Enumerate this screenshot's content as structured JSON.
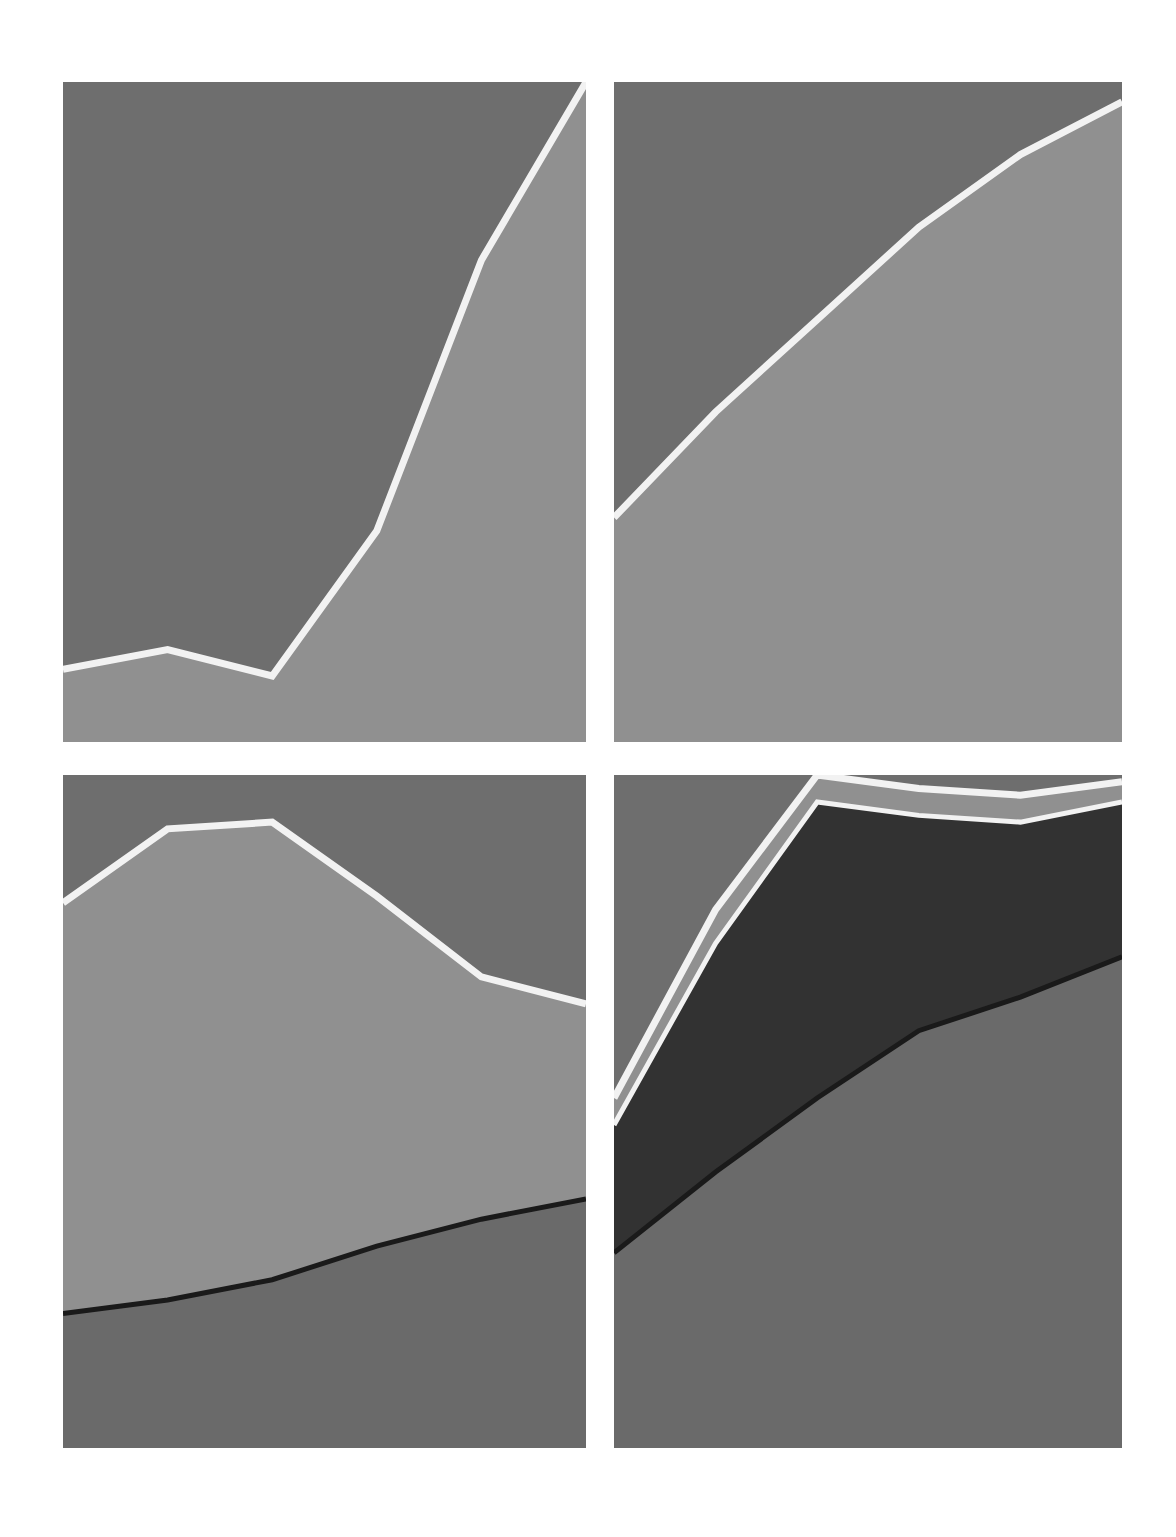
{
  "figure": {
    "background_color": "#ffffff",
    "layout": "2x2 grid of small-multiple stacked area charts",
    "panel_count": 4,
    "has_axes": false,
    "has_tick_labels": false,
    "has_legend": false,
    "has_title": false
  },
  "palette": {
    "plot_background": "#6e6e6e",
    "band_light": "#909090",
    "band_mid": "#6e6e6e",
    "band_dark": "#323232",
    "band_base": "#6a6a6a",
    "boundary_line": "#f2f2f2",
    "thin_dark_line": "#1a1a1a",
    "page_background": "#ffffff"
  },
  "chart_data": [
    {
      "id": "panel-top-left",
      "type": "area",
      "title": "",
      "subtitle": "",
      "xlabel": "",
      "ylabel": "",
      "grid": false,
      "legend_position": "none",
      "x": [
        0,
        1,
        2,
        3,
        4,
        5
      ],
      "xlim": [
        0,
        5
      ],
      "ylim": [
        0,
        100
      ],
      "xtick_labels": [],
      "ytick_labels": [],
      "series": [
        {
          "name": "lower band",
          "color": "#909090",
          "values": [
            11,
            14,
            10,
            32,
            73,
            100
          ]
        },
        {
          "name": "upper band",
          "color": "#6e6e6e",
          "values": [
            89,
            86,
            90,
            68,
            27,
            0
          ]
        }
      ],
      "annotations": []
    },
    {
      "id": "panel-top-right",
      "type": "area",
      "title": "",
      "subtitle": "",
      "xlabel": "",
      "ylabel": "",
      "grid": false,
      "legend_position": "none",
      "x": [
        0,
        1,
        2,
        3,
        4,
        5
      ],
      "xlim": [
        0,
        5
      ],
      "ylim": [
        0,
        100
      ],
      "xtick_labels": [],
      "ytick_labels": [],
      "series": [
        {
          "name": "lower band",
          "color": "#909090",
          "values": [
            34,
            50,
            64,
            78,
            89,
            97
          ]
        },
        {
          "name": "upper band",
          "color": "#6e6e6e",
          "values": [
            66,
            50,
            36,
            22,
            11,
            3
          ]
        }
      ],
      "annotations": []
    },
    {
      "id": "panel-bottom-left",
      "type": "area",
      "title": "",
      "subtitle": "",
      "xlabel": "",
      "ylabel": "",
      "grid": false,
      "legend_position": "none",
      "x": [
        0,
        1,
        2,
        3,
        4,
        5
      ],
      "xlim": [
        0,
        5
      ],
      "ylim": [
        0,
        100
      ],
      "xtick_labels": [],
      "ytick_labels": [],
      "series": [
        {
          "name": "base band",
          "color": "#6a6a6a",
          "values": [
            20,
            22,
            25,
            30,
            34,
            37
          ]
        },
        {
          "name": "middle band",
          "color": "#909090",
          "values": [
            61,
            70,
            68,
            52,
            36,
            29
          ]
        },
        {
          "name": "top band",
          "color": "#6e6e6e",
          "values": [
            19,
            8,
            7,
            18,
            30,
            34
          ]
        }
      ],
      "annotations": []
    },
    {
      "id": "panel-bottom-right",
      "type": "area",
      "title": "",
      "subtitle": "",
      "xlabel": "",
      "ylabel": "",
      "grid": false,
      "legend_position": "none",
      "x": [
        0,
        1,
        2,
        3,
        4,
        5
      ],
      "xlim": [
        0,
        5
      ],
      "ylim": [
        0,
        100
      ],
      "xtick_labels": [],
      "ytick_labels": [],
      "series": [
        {
          "name": "base band",
          "color": "#6a6a6a",
          "values": [
            29,
            41,
            52,
            62,
            67,
            73
          ]
        },
        {
          "name": "dark band",
          "color": "#323232",
          "values": [
            19,
            34,
            44,
            32,
            26,
            23
          ]
        },
        {
          "name": "light band",
          "color": "#909090",
          "values": [
            4,
            5,
            4,
            4,
            4,
            3
          ]
        },
        {
          "name": "top band",
          "color": "#6e6e6e",
          "values": [
            48,
            20,
            0,
            2,
            3,
            1
          ]
        }
      ],
      "annotations": []
    }
  ]
}
